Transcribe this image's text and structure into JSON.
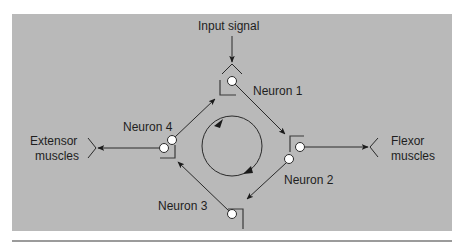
{
  "figure": {
    "colors": {
      "panel_background": "#b9b9b9",
      "line": "#2a2a2a",
      "soma_fill": "#ffffff",
      "page_background": "#ffffff",
      "bottom_rule": "#7a7a7a"
    },
    "labels": {
      "input_signal": "Input signal",
      "neuron_1": "Neuron 1",
      "neuron_2": "Neuron 2",
      "neuron_3": "Neuron 3",
      "neuron_4": "Neuron 4",
      "extensor_line1": "Extensor",
      "extensor_line2": "muscles",
      "flexor_line1": "Flexor",
      "flexor_line2": "muscles"
    },
    "cycle_direction": "clockwise"
  }
}
